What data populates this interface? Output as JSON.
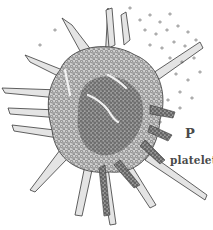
{
  "figure": {
    "labels": {
      "letter": "P",
      "caption": "platelet"
    },
    "colors": {
      "background": "#ffffff",
      "ink": "#3a3a3a",
      "fill_light": "#dcdcdc",
      "fill_dark": "#8a8a8a",
      "label": "#4a4a4a"
    }
  }
}
